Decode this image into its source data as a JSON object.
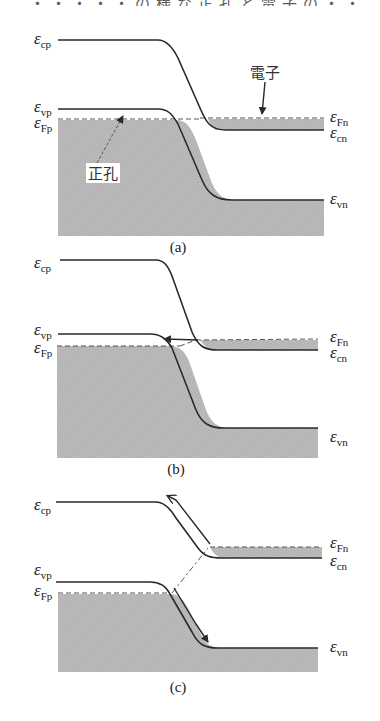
{
  "header_clipped_text": "・・・・・の様な正孔と電子の・・",
  "panels": [
    {
      "id": "a",
      "caption": "(a)",
      "labels": {
        "ecp": {
          "sym": "ε",
          "sub": "cp"
        },
        "evp": {
          "sym": "ε",
          "sub": "vp"
        },
        "efp": {
          "sym": "ε",
          "sub": "Fp"
        },
        "efn": {
          "sym": "ε",
          "sub": "Fn"
        },
        "ecn": {
          "sym": "ε",
          "sub": "cn"
        },
        "evn": {
          "sym": "ε",
          "sub": "vn"
        }
      },
      "annotations": {
        "electron": "電子",
        "hole": "正孔"
      }
    },
    {
      "id": "b",
      "caption": "(b)",
      "labels": {
        "ecp": {
          "sym": "ε",
          "sub": "cp"
        },
        "evp": {
          "sym": "ε",
          "sub": "vp"
        },
        "efp": {
          "sym": "ε",
          "sub": "Fp"
        },
        "efn": {
          "sym": "ε",
          "sub": "Fn"
        },
        "ecn": {
          "sym": "ε",
          "sub": "cn"
        },
        "evn": {
          "sym": "ε",
          "sub": "vn"
        }
      }
    },
    {
      "id": "c",
      "caption": "(c)",
      "labels": {
        "ecp": {
          "sym": "ε",
          "sub": "cp"
        },
        "evp": {
          "sym": "ε",
          "sub": "vp"
        },
        "efp": {
          "sym": "ε",
          "sub": "Fp"
        },
        "efn": {
          "sym": "ε",
          "sub": "Fn"
        },
        "ecn": {
          "sym": "ε",
          "sub": "cn"
        },
        "evn": {
          "sym": "ε",
          "sub": "vn"
        }
      }
    }
  ],
  "colors": {
    "fill": "#b8b8b8",
    "line": "#2a2a2a",
    "background": "#ffffff"
  }
}
